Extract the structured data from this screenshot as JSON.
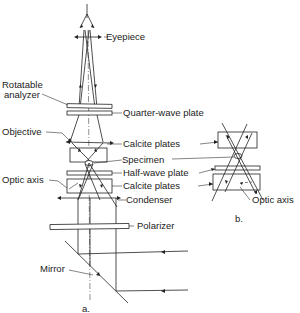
{
  "figure": {
    "panels": [
      {
        "id": "a",
        "label": "a."
      },
      {
        "id": "b",
        "label": "b."
      }
    ],
    "labels": {
      "eyepiece": "Eyepiece",
      "rotatable_analyzer_line1": "Rotatable",
      "rotatable_analyzer_line2": "analyzer",
      "quarter_wave_plate": "Quarter-wave plate",
      "objective": "Objective",
      "calcite_plates_top": "Calcite plates",
      "specimen": "Specimen",
      "optic_axis_left": "Optic axis",
      "half_wave_plate": "Half-wave plate",
      "calcite_plates_bottom": "Calcite plates",
      "condenser": "Condenser",
      "polarizer": "Polarizer",
      "mirror": "Mirror",
      "optic_axis_right": "Optic axis",
      "panel_a": "a.",
      "panel_b": "b."
    },
    "colors": {
      "ink": "#222222",
      "background": "#ffffff"
    }
  }
}
